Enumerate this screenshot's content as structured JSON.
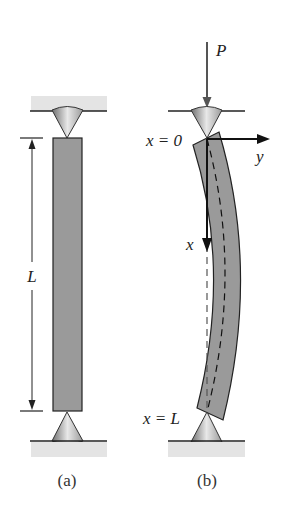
{
  "figure": {
    "panels": [
      {
        "id": "a",
        "caption": "(a)",
        "description": "Straight pin-ended column",
        "length_label": "L"
      },
      {
        "id": "b",
        "caption": "(b)",
        "description": "Buckled column under axial load",
        "load_label": "P",
        "top_label": "x = 0",
        "bottom_label": "x = L",
        "x_axis_label": "x",
        "y_axis_label": "y"
      }
    ],
    "colors": {
      "column_fill": "#9a9a9a",
      "support_band": "#e4e4e4",
      "line": "#222222"
    }
  }
}
